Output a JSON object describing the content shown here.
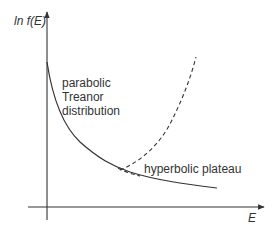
{
  "diagram": {
    "axes": {
      "y_label": "ln f(E)",
      "x_label": "E"
    },
    "labels": {
      "parabolic": [
        "parabolic",
        "Treanor",
        "distribution"
      ],
      "hyperbolic": "hyperbolic plateau"
    },
    "curves": [
      {
        "name": "Treanor distribution",
        "style": "solid",
        "description": "decreasing curve from y-axis, parabolic then hyperbolic plateau"
      },
      {
        "name": "parabolic continuation",
        "style": "dashed",
        "description": "rises sharply after the branching point"
      }
    ],
    "colors": {
      "stroke": "#333333",
      "text": "#333333",
      "background": "#ffffff"
    }
  }
}
